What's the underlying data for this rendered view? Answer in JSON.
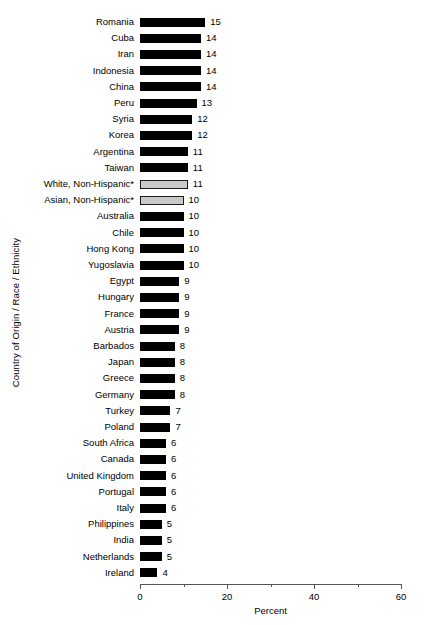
{
  "chart_data": {
    "type": "bar",
    "orientation": "horizontal",
    "title": "",
    "subtitle": "",
    "xlabel": "Percent",
    "ylabel": "Country of Origin / Race / Ethnicity",
    "xlim": [
      0,
      60
    ],
    "xticks": [
      0,
      20,
      40,
      60
    ],
    "xtick_labels": [
      "0",
      "20",
      "40",
      "60"
    ],
    "xminor_ticks": [
      10,
      30,
      50
    ],
    "grid": false,
    "legend": null,
    "categories": [
      "Romania",
      "Cuba",
      "Iran",
      "Indonesia",
      "China",
      "Peru",
      "Syria",
      "Korea",
      "Argentina",
      "Taiwan",
      "White, Non-Hispanic*",
      "Asian, Non-Hispanic*",
      "Australia",
      "Chile",
      "Hong Kong",
      "Yugoslavia",
      "Egypt",
      "Hungary",
      "France",
      "Austria",
      "Barbados",
      "Japan",
      "Greece",
      "Germany",
      "Turkey",
      "Poland",
      "South Africa",
      "Canada",
      "United Kingdom",
      "Portugal",
      "Italy",
      "Philippines",
      "India",
      "Netherlands",
      "Ireland"
    ],
    "values": [
      15,
      14,
      14,
      14,
      14,
      13,
      12,
      12,
      11,
      11,
      11,
      10,
      10,
      10,
      10,
      10,
      9,
      9,
      9,
      9,
      8,
      8,
      8,
      8,
      7,
      7,
      6,
      6,
      6,
      6,
      6,
      5,
      5,
      5,
      4
    ],
    "bar_styles": [
      "solid",
      "solid",
      "solid",
      "solid",
      "solid",
      "solid",
      "solid",
      "solid",
      "solid",
      "solid",
      "hollow",
      "hollow",
      "solid",
      "solid",
      "solid",
      "solid",
      "solid",
      "solid",
      "solid",
      "solid",
      "solid",
      "solid",
      "solid",
      "solid",
      "solid",
      "solid",
      "solid",
      "solid",
      "solid",
      "solid",
      "solid",
      "solid",
      "solid",
      "solid",
      "solid"
    ],
    "colors": {
      "solid_bar": "#000000",
      "hollow_bar_fill": "#c9c9c9",
      "hollow_bar_border": "#1a1a1a",
      "axis": "#555555",
      "text": "#000000",
      "background": "#ffffff"
    }
  }
}
